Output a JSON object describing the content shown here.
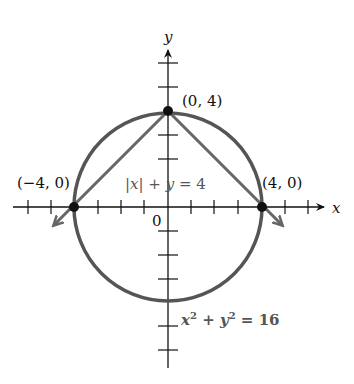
{
  "diagram": {
    "axes": {
      "x_label": "x",
      "y_label": "y",
      "origin_label": "0",
      "x_ticks": [
        -6,
        -5,
        -4,
        -3,
        -2,
        -1,
        1,
        2,
        3,
        4,
        5,
        6
      ],
      "y_ticks": [
        -4,
        -3,
        -2,
        -1,
        1,
        2,
        3,
        4,
        5
      ]
    },
    "curves": [
      {
        "name": "circle",
        "equation": "x² + y² = 16",
        "radius": 4,
        "color": "#555555"
      },
      {
        "name": "abs-line",
        "equation": "|x| + y = 4",
        "color": "#666666"
      }
    ],
    "points": [
      {
        "label": "(0, 4)",
        "x": 0,
        "y": 4
      },
      {
        "label": "(−4, 0)",
        "x": -4,
        "y": 0
      },
      {
        "label": "(4, 0)",
        "x": 4,
        "y": 0
      }
    ],
    "labels": {
      "abs_eq": {
        "part1": "|",
        "x": "x",
        "part2": "| + ",
        "y": "y",
        "part3": " = 4"
      },
      "circle_eq": {
        "x": "x",
        "exp": "2",
        "plus": " + ",
        "y": "y",
        "exp2": "2",
        "rhs": " = 16"
      }
    }
  }
}
